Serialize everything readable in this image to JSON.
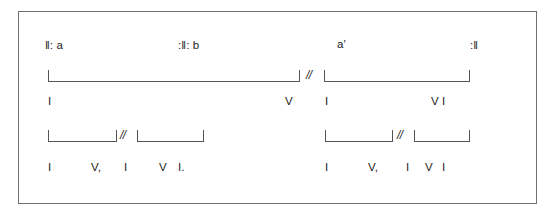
{
  "diagram": {
    "frame": {
      "border_color": "#6f6f6f",
      "background": "#ffffff"
    },
    "ink_color": "#1b1b1b",
    "line_color": "#555555",
    "separator": "//",
    "sections": [
      {
        "id": "section-a-open",
        "label": "‖: a"
      },
      {
        "id": "section-b",
        "label": ":‖: b"
      },
      {
        "id": "section-a-prime",
        "label": "a′"
      },
      {
        "id": "section-close",
        "label": ":‖"
      }
    ],
    "phrase_brackets": [
      {
        "id": "phrase-bracket-1",
        "part": "left"
      },
      {
        "id": "phrase-bracket-2",
        "part": "right"
      }
    ],
    "phrase_separators": [
      {
        "id": "phrase-separator-main",
        "label": "//"
      },
      {
        "id": "phrase-separator-sub-left",
        "label": "//"
      },
      {
        "id": "phrase-separator-sub-right",
        "label": "//"
      }
    ],
    "harmony_row_upper": {
      "id": "harmony-upper",
      "tokens": [
        {
          "id": "upper-1",
          "label": "I"
        },
        {
          "id": "upper-2",
          "label": "V"
        },
        {
          "id": "upper-3",
          "label": "I"
        },
        {
          "id": "upper-4",
          "label": "V I"
        }
      ]
    },
    "sub_brackets": [
      {
        "id": "sub-bracket-1"
      },
      {
        "id": "sub-bracket-2"
      },
      {
        "id": "sub-bracket-3"
      },
      {
        "id": "sub-bracket-4"
      }
    ],
    "harmony_row_lower": {
      "id": "harmony-lower",
      "tokens": [
        {
          "id": "lower-1",
          "label": "I"
        },
        {
          "id": "lower-2",
          "label": "V,"
        },
        {
          "id": "lower-3",
          "label": "I"
        },
        {
          "id": "lower-4",
          "label": "V"
        },
        {
          "id": "lower-5",
          "label": "I."
        },
        {
          "id": "lower-6",
          "label": "I"
        },
        {
          "id": "lower-7",
          "label": "V,"
        },
        {
          "id": "lower-8",
          "label": "I"
        },
        {
          "id": "lower-9",
          "label": "V"
        },
        {
          "id": "lower-10",
          "label": "I"
        }
      ]
    }
  }
}
